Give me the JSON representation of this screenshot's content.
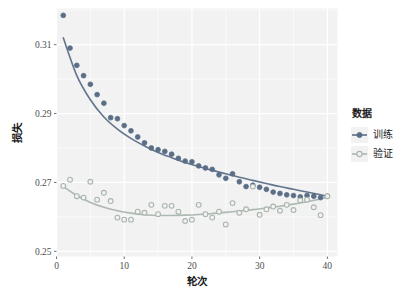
{
  "chart_data": {
    "type": "scatter",
    "title": "",
    "xlabel": "轮次",
    "ylabel": "损失",
    "xlim": [
      0,
      41.5
    ],
    "ylim": [
      0.2485,
      0.3205
    ],
    "xticks": [
      0,
      10,
      20,
      30,
      40
    ],
    "xticklabels": [
      "0",
      "10",
      "20",
      "30",
      "40"
    ],
    "yticks": [
      0.25,
      0.27,
      0.29,
      0.31
    ],
    "yticklabels": [
      "0.25",
      "0.27",
      "0.29",
      "0.31"
    ],
    "grid": true,
    "grid_color": "#ffffff",
    "panel_background": "#f2f2f2",
    "legend": {
      "title": "数据",
      "position": "right",
      "entries": [
        {
          "label": "训练",
          "color": "#5a6e87",
          "marker": "filled-circle"
        },
        {
          "label": "验证",
          "color": "#a9b5ad",
          "marker": "open-circle"
        }
      ]
    },
    "series": [
      {
        "name": "训练",
        "color": "#5a6e87",
        "marker": "filled-circle",
        "x": [
          1,
          2,
          3,
          4,
          5,
          6,
          7,
          8,
          9,
          10,
          11,
          12,
          13,
          14,
          15,
          16,
          17,
          18,
          19,
          20,
          21,
          22,
          23,
          24,
          25,
          26,
          27,
          28,
          29,
          30,
          31,
          32,
          33,
          34,
          35,
          36,
          37,
          38,
          39,
          40
        ],
        "y": [
          0.3185,
          0.309,
          0.304,
          0.301,
          0.2985,
          0.2955,
          0.293,
          0.2888,
          0.2885,
          0.2865,
          0.285,
          0.2832,
          0.2815,
          0.28,
          0.2795,
          0.279,
          0.2782,
          0.277,
          0.2762,
          0.276,
          0.2748,
          0.2742,
          0.2738,
          0.2722,
          0.2712,
          0.2725,
          0.2702,
          0.2688,
          0.2692,
          0.2686,
          0.268,
          0.2672,
          0.2668,
          0.2664,
          0.2662,
          0.2658,
          0.2662,
          0.266,
          0.2656,
          0.266
        ],
        "trend": {
          "x": [
            1,
            3,
            5,
            7,
            9,
            11,
            13,
            15,
            17,
            19,
            21,
            23,
            25,
            27,
            29,
            31,
            33,
            35,
            37,
            39,
            40
          ],
          "y": [
            0.312,
            0.301,
            0.294,
            0.289,
            0.2855,
            0.2828,
            0.2806,
            0.2787,
            0.2772,
            0.2758,
            0.2746,
            0.2735,
            0.2725,
            0.2715,
            0.2706,
            0.2697,
            0.2688,
            0.268,
            0.2672,
            0.2664,
            0.266
          ]
        }
      },
      {
        "name": "验证",
        "color": "#a9b5ad",
        "marker": "open-circle",
        "x": [
          1,
          2,
          3,
          4,
          5,
          6,
          7,
          8,
          9,
          10,
          11,
          12,
          13,
          14,
          15,
          16,
          17,
          18,
          19,
          20,
          21,
          22,
          23,
          24,
          25,
          26,
          27,
          28,
          29,
          30,
          31,
          32,
          33,
          34,
          35,
          36,
          37,
          38,
          39,
          40
        ],
        "y": [
          0.269,
          0.2708,
          0.266,
          0.2656,
          0.2702,
          0.265,
          0.267,
          0.2646,
          0.2598,
          0.2592,
          0.2592,
          0.2615,
          0.2612,
          0.2635,
          0.2608,
          0.2632,
          0.2632,
          0.2615,
          0.2588,
          0.2592,
          0.2635,
          0.2608,
          0.2598,
          0.2615,
          0.2578,
          0.264,
          0.2612,
          0.2622,
          0.2688,
          0.2606,
          0.2622,
          0.263,
          0.2618,
          0.2635,
          0.262,
          0.2648,
          0.265,
          0.2628,
          0.2605,
          0.266
        ],
        "trend": {
          "x": [
            1,
            3,
            5,
            7,
            9,
            11,
            13,
            15,
            17,
            19,
            21,
            23,
            25,
            27,
            29,
            31,
            33,
            35,
            37,
            39,
            40
          ],
          "y": [
            0.2688,
            0.2662,
            0.2642,
            0.2628,
            0.2618,
            0.2611,
            0.2606,
            0.2604,
            0.2604,
            0.2605,
            0.2607,
            0.261,
            0.2613,
            0.2617,
            0.2621,
            0.2626,
            0.2631,
            0.2637,
            0.2644,
            0.2652,
            0.2657
          ]
        }
      }
    ]
  }
}
